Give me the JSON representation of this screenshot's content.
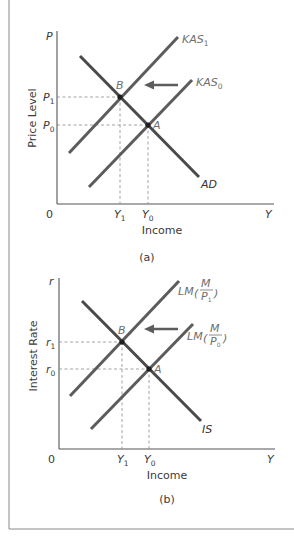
{
  "figure": {
    "panel_a": {
      "caption": "(a)",
      "y_axis_symbol": "P",
      "y_axis_label": "Price Level",
      "x_axis_label": "Income",
      "origin_label": "0",
      "x_axis_symbol": "Y",
      "y_ticks": [
        {
          "base": "P",
          "sub": "1"
        },
        {
          "base": "P",
          "sub": "0"
        }
      ],
      "x_ticks": [
        {
          "base": "Y",
          "sub": "1"
        },
        {
          "base": "Y",
          "sub": "0"
        }
      ],
      "curves": {
        "kas1": {
          "base": "KAS",
          "sub": "1"
        },
        "kas0": {
          "base": "KAS",
          "sub": "0"
        },
        "ad": "AD"
      },
      "points": {
        "b": "B",
        "a": "A"
      },
      "shift_direction": "left"
    },
    "panel_b": {
      "caption": "(b)",
      "y_axis_symbol": "r",
      "y_axis_label": "Interest Rate",
      "x_axis_label": "Income",
      "origin_label": "0",
      "x_axis_symbol": "Y",
      "y_ticks": [
        {
          "base": "r",
          "sub": "1"
        },
        {
          "base": "r",
          "sub": "0"
        }
      ],
      "x_ticks": [
        {
          "base": "Y",
          "sub": "1"
        },
        {
          "base": "Y",
          "sub": "0"
        }
      ],
      "curves": {
        "lm1": {
          "base": "LM",
          "num": "M",
          "den_base": "P",
          "den_sub": "1"
        },
        "lm0": {
          "base": "LM",
          "num": "M",
          "den_base": "P",
          "den_sub": "0"
        },
        "is": "IS"
      },
      "points": {
        "b": "B",
        "a": "A"
      },
      "shift_direction": "left"
    }
  },
  "colors": {
    "curve": "#5c5c5c",
    "axis": "#555555",
    "guide": "#8a8a8a",
    "point": "#1e1e1e",
    "label": "#3a3a3a",
    "curve_label": "#6e6e6e"
  }
}
